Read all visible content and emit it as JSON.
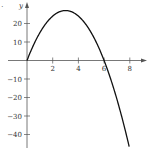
{
  "corner_label": ".",
  "chart_data": {
    "type": "line",
    "title": "",
    "xlabel": "",
    "ylabel": "y",
    "x_ticks": [
      2,
      4,
      6,
      8
    ],
    "y_ticks": [
      20,
      10,
      -10,
      -20,
      -30,
      -40
    ],
    "xlim": [
      0,
      9
    ],
    "ylim": [
      -48,
      30
    ],
    "grid": false,
    "legend": "none",
    "series": [
      {
        "name": "y = 18x - 3x^2",
        "x": [
          0,
          1,
          2,
          3,
          4,
          5,
          6,
          7,
          8
        ],
        "values": [
          0,
          15,
          24,
          27,
          24,
          15,
          0,
          -21,
          -48
        ],
        "color": "#111111"
      }
    ]
  }
}
